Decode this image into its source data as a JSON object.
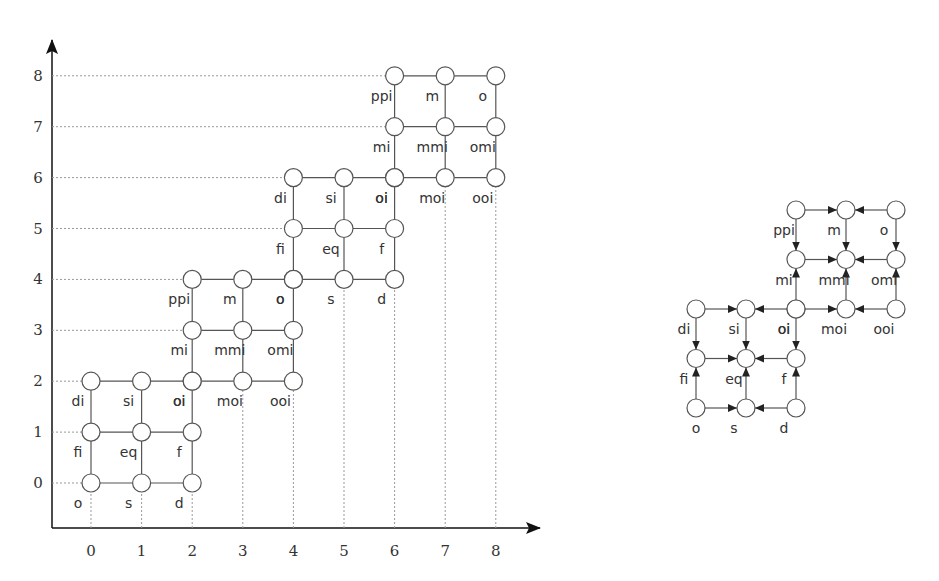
{
  "left_diagram": {
    "x_ticks": [
      "0",
      "1",
      "2",
      "3",
      "4",
      "5",
      "6",
      "7",
      "8"
    ],
    "y_ticks": [
      "0",
      "1",
      "2",
      "3",
      "4",
      "5",
      "6",
      "7",
      "8"
    ],
    "blocks": [
      {
        "origin": [
          0,
          0
        ],
        "labels": [
          [
            "o",
            "s",
            "d"
          ],
          [
            "fi",
            "eq",
            "f"
          ],
          [
            "di",
            "si",
            "oi"
          ]
        ]
      },
      {
        "origin": [
          2,
          2
        ],
        "labels": [
          [
            "oi",
            "moi",
            "ooi"
          ],
          [
            "mi",
            "mmi",
            "omi"
          ],
          [
            "ppi",
            "m",
            "o"
          ]
        ]
      },
      {
        "origin": [
          4,
          4
        ],
        "labels": [
          [
            "o",
            "s",
            "d"
          ],
          [
            "fi",
            "eq",
            "f"
          ],
          [
            "di",
            "si",
            "oi"
          ]
        ]
      },
      {
        "origin": [
          6,
          6
        ],
        "labels": [
          [
            "oi",
            "moi",
            "ooi"
          ],
          [
            "mi",
            "mmi",
            "omi"
          ],
          [
            "ppi",
            "m",
            "o"
          ]
        ]
      }
    ]
  },
  "right_diagram": {
    "lower_block": {
      "labels": [
        [
          "o",
          "s",
          "d"
        ],
        [
          "fi",
          "eq",
          "f"
        ],
        [
          "di",
          "si",
          "oi"
        ]
      ]
    },
    "upper_block": {
      "labels": [
        [
          "oi",
          "moi",
          "ooi"
        ],
        [
          "mi",
          "mmi",
          "omi"
        ],
        [
          "ppi",
          "m",
          "o"
        ]
      ]
    },
    "arrow_rule": "corners point to edge-midpoints; edge-midpoints point to center"
  },
  "colors": {
    "line": "#555555",
    "dotted": "#999999",
    "text": "#333333"
  }
}
